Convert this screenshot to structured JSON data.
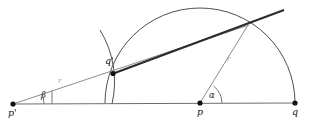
{
  "figure": {
    "width": 313,
    "height": 125,
    "background": "#ffffff",
    "colors": {
      "baseline": "#6e6e6e",
      "thin_ray": "#8d8d8d",
      "thick_ray": "#2b2b2b",
      "arc_large": "#3a3a3a",
      "arc_small": "#3a3a3a",
      "angle_arc": "#555555",
      "point_fill": "#111111",
      "label_text": "#111111",
      "radius_label": "#9a9a9a"
    }
  },
  "points": [
    {
      "id": "p-prime",
      "label": "p'",
      "x": 13,
      "y": 104,
      "label_x": 9,
      "label_y": 109
    },
    {
      "id": "q-prime",
      "label": "q'",
      "x": 113,
      "y": 73,
      "label_x": 105,
      "label_y": 58
    },
    {
      "id": "p",
      "label": "p",
      "x": 200,
      "y": 103,
      "label_x": 197,
      "label_y": 108
    },
    {
      "id": "q",
      "label": "q",
      "x": 295,
      "y": 103,
      "label_x": 292,
      "label_y": 108
    }
  ],
  "angles": [
    {
      "id": "beta",
      "label": "β",
      "vertex": "p-prime",
      "label_x": 41,
      "label_y": 92,
      "arc_radius": 28
    },
    {
      "id": "alpha",
      "label": "α",
      "vertex": "p",
      "label_x": 211,
      "label_y": 92,
      "arc_radius": 19
    }
  ],
  "segment_labels": [
    {
      "id": "r-left",
      "label": "r",
      "x": 59,
      "y": 80
    },
    {
      "id": "r-right",
      "label": "r",
      "x": 228,
      "y": 58
    }
  ],
  "arcs": [
    {
      "id": "large-semicircle",
      "center": "p",
      "radius": 95,
      "note": "semicircle centered at p through q"
    },
    {
      "id": "small-arc",
      "center": "p-prime",
      "radius": 99,
      "note": "arc centered at p' through q'"
    }
  ],
  "rays": [
    {
      "id": "baseline",
      "from": "p-prime",
      "to": "q",
      "style": "thin"
    },
    {
      "id": "ray-p-prime-through-q-prime",
      "from": "p-prime",
      "to": "intersection",
      "style": "thin"
    },
    {
      "id": "thick-ray",
      "from": "q-prime",
      "to": "beyond-intersection",
      "style": "thick"
    },
    {
      "id": "radius-p-to-intersection",
      "from": "p",
      "to": "intersection",
      "style": "thin"
    }
  ],
  "intersection": {
    "id": "intersection",
    "x": 248,
    "y": 25
  }
}
